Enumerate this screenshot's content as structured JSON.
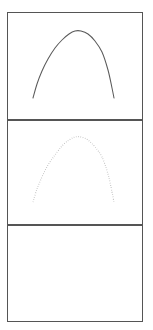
{
  "figure": {
    "title": "",
    "width": 153,
    "height": 330,
    "background_color": "#ffffff",
    "panel_count": 3,
    "layout": "three stacked rectangular panels, shared width",
    "frame_color": "#555555",
    "frame_x_left": 7,
    "frame_x_right": 143,
    "panel_tops": [
      12,
      120,
      225
    ],
    "panel_bottoms": [
      120,
      225,
      322
    ]
  },
  "chart_data": {
    "type": "line",
    "title": "",
    "subtitle": "",
    "xlabel": "",
    "ylabel": "",
    "grid": false,
    "legend": "none",
    "xlim": [
      0,
      1
    ],
    "ylim": [
      0,
      1
    ],
    "axis_ticks_visible": false,
    "axis_tick_labels": [],
    "panels": [
      {
        "panel_index": 1,
        "panel_name": "top-panel",
        "content": "solid-arch-curve",
        "empty": false,
        "series": [
          {
            "name": "solid-arch",
            "style": "solid",
            "color": "#5a5a5a",
            "linewidth": 1.05,
            "shape": "parabolic arch",
            "apex_x": 75,
            "apex_y": 31,
            "left_end_x": 33,
            "left_end_y": 98,
            "right_end_x": 114,
            "right_end_y": 98,
            "x": [
              33,
              37,
              42,
              48,
              55,
              62,
              69,
              75,
              81,
              88,
              95,
              102,
              108,
              112,
              114
            ],
            "y": [
              98,
              84,
              71,
              59,
              48,
              40,
              34,
              31,
              31,
              34,
              41,
              52,
              70,
              88,
              98
            ]
          }
        ]
      },
      {
        "panel_index": 2,
        "panel_name": "middle-panel",
        "content": "dotted-arch-curve",
        "empty": false,
        "series": [
          {
            "name": "dotted-arch",
            "style": "dotted",
            "color": "#a8a8a8",
            "linewidth": 1.15,
            "shape": "parabolic arch",
            "apex_x": 75,
            "apex_y": 137,
            "left_end_x": 33,
            "left_end_y": 202,
            "right_end_x": 114,
            "right_end_y": 202,
            "x": [
              33,
              37,
              42,
              48,
              55,
              62,
              69,
              75,
              81,
              88,
              95,
              102,
              108,
              112,
              114
            ],
            "y": [
              202,
              189,
              177,
              165,
              155,
              146,
              140,
              137,
              137,
              140,
              147,
              157,
              174,
              192,
              202
            ]
          }
        ]
      },
      {
        "panel_index": 3,
        "panel_name": "bottom-panel",
        "content": "empty",
        "empty": true,
        "series": []
      }
    ]
  }
}
